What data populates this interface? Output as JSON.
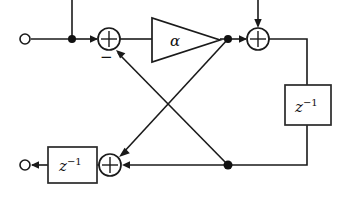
{
  "figure": {
    "type": "signal-flow-diagram",
    "canvas": {
      "width": 349,
      "height": 204
    },
    "background_color": "#ffffff",
    "line_color": "#1a1a1a"
  },
  "terminals": [
    {
      "id": "input-terminal-top-left",
      "label": "",
      "shape": "open-circle",
      "x": 25,
      "y": 39
    },
    {
      "id": "output-terminal-bottom-left",
      "label": "",
      "shape": "open-circle",
      "x": 25,
      "y": 165
    }
  ],
  "blocks": {
    "gain": {
      "label": "α",
      "shape": "triangle",
      "direction": "right",
      "x": 152,
      "y": 18,
      "width": 68,
      "height": 44
    },
    "delay_right": {
      "label_base": "z",
      "label_exponent": "−1",
      "shape": "rectangle",
      "x": 285,
      "y": 85,
      "width": 46,
      "height": 40
    },
    "delay_bottom": {
      "label_base": "z",
      "label_exponent": "−1",
      "shape": "rectangle",
      "x": 48,
      "y": 147,
      "width": 49,
      "height": 36
    }
  },
  "adders": [
    {
      "id": "adder-top-left",
      "x": 109,
      "y": 39,
      "radius": 11,
      "sign_label": "−",
      "sign_x": 100,
      "sign_y": 58
    },
    {
      "id": "adder-top-right",
      "x": 258,
      "y": 39,
      "radius": 11,
      "sign_label": "",
      "sign_x": 0,
      "sign_y": 0
    },
    {
      "id": "adder-bottom",
      "x": 110,
      "y": 165,
      "radius": 11,
      "sign_label": "",
      "sign_x": 0,
      "sign_y": 0
    }
  ],
  "junction_dots": [
    {
      "id": "branch-dot-input",
      "x": 72,
      "y": 39
    },
    {
      "id": "branch-dot-after-gain",
      "x": 228,
      "y": 39
    },
    {
      "id": "branch-dot-bottom-feedback",
      "x": 228,
      "y": 165
    }
  ],
  "labels": {
    "alpha": "α",
    "delay": "z⁻¹",
    "minus": "−"
  }
}
